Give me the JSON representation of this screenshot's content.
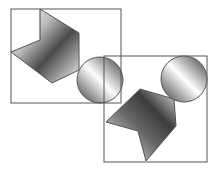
{
  "diagram": {
    "type": "spatial-reasoning-figure",
    "background": "#ffffff",
    "stroke_color": "#555555",
    "panels": [
      {
        "id": "panel-1",
        "frame": {
          "x": 11,
          "y": 9,
          "w": 110,
          "h": 94
        },
        "shapes": [
          {
            "kind": "bent-plane",
            "points": "40,9 79,33 79,70 52,83 11,52 40,40"
          },
          {
            "kind": "sphere",
            "cx": 100,
            "cy": 80,
            "r": 23
          }
        ]
      },
      {
        "id": "panel-2",
        "frame": {
          "x": 104,
          "y": 56,
          "w": 103,
          "h": 106
        },
        "shapes": [
          {
            "kind": "bent-plane",
            "points": "140,89 174,99 176,126 146,161 138,131 106,122"
          },
          {
            "kind": "sphere",
            "cx": 184,
            "cy": 79,
            "r": 23
          }
        ]
      }
    ]
  }
}
